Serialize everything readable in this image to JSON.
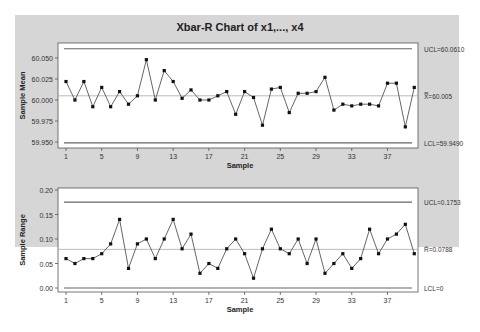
{
  "chart_data": [
    {
      "type": "line",
      "title": "Xbar-R Chart of x1,..., x4",
      "xlabel": "Sample",
      "ylabel": "Sample Mean",
      "ylim": [
        59.945,
        60.066
      ],
      "yticks": [
        "60.050",
        "60.025",
        "60.000",
        "59.975",
        "59.950"
      ],
      "xticks": [
        "1",
        "5",
        "9",
        "13",
        "17",
        "21",
        "25",
        "29",
        "33",
        "37"
      ],
      "x": [
        1,
        2,
        3,
        4,
        5,
        6,
        7,
        8,
        9,
        10,
        11,
        12,
        13,
        14,
        15,
        16,
        17,
        18,
        19,
        20,
        21,
        22,
        23,
        24,
        25,
        26,
        27,
        28,
        29,
        30,
        31,
        32,
        33,
        34,
        35,
        36,
        37,
        38,
        39,
        40
      ],
      "values": [
        60.022,
        60.0,
        60.022,
        59.992,
        60.015,
        59.992,
        60.01,
        59.995,
        60.005,
        60.048,
        60.0,
        60.035,
        60.022,
        60.002,
        60.012,
        60.0,
        60.0,
        60.005,
        60.01,
        59.983,
        60.01,
        60.003,
        59.97,
        60.013,
        60.015,
        59.985,
        60.008,
        60.008,
        60.01,
        60.027,
        59.988,
        59.995,
        59.993,
        59.995,
        59.995,
        59.993,
        60.02,
        60.02,
        59.968,
        60.015
      ],
      "ucl": 60.061,
      "center": 60.005,
      "lcl": 59.949,
      "ucl_label": "UCL=60.0610",
      "center_label": "X̿=60.005",
      "lcl_label": "LCL=59.9490",
      "grid": false
    },
    {
      "type": "line",
      "xlabel": "Sample",
      "ylabel": "Sample Range",
      "ylim": [
        -0.005,
        0.2
      ],
      "yticks": [
        "0.20",
        "0.15",
        "0.10",
        "0.05",
        "0.00"
      ],
      "xticks": [
        "1",
        "5",
        "9",
        "13",
        "17",
        "21",
        "25",
        "29",
        "33",
        "37"
      ],
      "x": [
        1,
        2,
        3,
        4,
        5,
        6,
        7,
        8,
        9,
        10,
        11,
        12,
        13,
        14,
        15,
        16,
        17,
        18,
        19,
        20,
        21,
        22,
        23,
        24,
        25,
        26,
        27,
        28,
        29,
        30,
        31,
        32,
        33,
        34,
        35,
        36,
        37,
        38,
        39,
        40
      ],
      "values": [
        0.06,
        0.05,
        0.06,
        0.06,
        0.07,
        0.09,
        0.14,
        0.04,
        0.09,
        0.1,
        0.06,
        0.1,
        0.14,
        0.08,
        0.11,
        0.03,
        0.05,
        0.04,
        0.08,
        0.1,
        0.07,
        0.02,
        0.08,
        0.12,
        0.08,
        0.07,
        0.1,
        0.05,
        0.1,
        0.03,
        0.05,
        0.07,
        0.04,
        0.06,
        0.12,
        0.07,
        0.1,
        0.11,
        0.13,
        0.07
      ],
      "ucl": 0.1753,
      "center": 0.0788,
      "lcl": 0,
      "ucl_label": "UCL=0.1753",
      "center_label": "R̄=0.0788",
      "lcl_label": "LCL=0",
      "grid": false
    }
  ]
}
